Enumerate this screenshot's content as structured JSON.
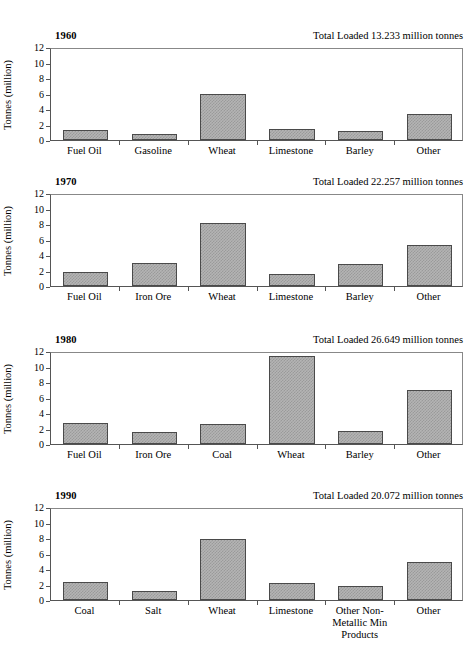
{
  "figure": {
    "ylabel": "Tonnes (million)",
    "y_ticks": [
      "12",
      "10",
      "8",
      "6",
      "4",
      "2",
      "0"
    ],
    "total_prefix": "Total Loaded"
  },
  "chart_data": [
    {
      "type": "bar",
      "title": "1960",
      "subtitle": "Total Loaded  13.233 million tonnes",
      "total_loaded": 13.233,
      "total_units": "million tonnes",
      "xlabel": "",
      "ylabel": "Tonnes (million)",
      "ylim": [
        0,
        12
      ],
      "yticks": [
        0,
        2,
        4,
        6,
        8,
        10,
        12
      ],
      "grid": false,
      "legend": "none",
      "categories": [
        "Fuel Oil",
        "Gasoline",
        "Wheat",
        "Limestone",
        "Barley",
        "Other"
      ],
      "values": [
        1.3,
        0.8,
        5.9,
        1.4,
        1.1,
        3.4
      ]
    },
    {
      "type": "bar",
      "title": "1970",
      "subtitle": "Total Loaded  22.257 million tonnes",
      "total_loaded": 22.257,
      "total_units": "million tonnes",
      "xlabel": "",
      "ylabel": "Tonnes (million)",
      "ylim": [
        0,
        12
      ],
      "yticks": [
        0,
        2,
        4,
        6,
        8,
        10,
        12
      ],
      "grid": false,
      "legend": "none",
      "categories": [
        "Fuel Oil",
        "Iron Ore",
        "Wheat",
        "Limestone",
        "Barley",
        "Other"
      ],
      "values": [
        1.8,
        2.95,
        8.1,
        1.5,
        2.8,
        5.3
      ]
    },
    {
      "type": "bar",
      "title": "1980",
      "subtitle": "Total Loaded  26.649 million tonnes",
      "total_loaded": 26.649,
      "total_units": "million tonnes",
      "xlabel": "",
      "ylabel": "Tonnes (million)",
      "ylim": [
        0,
        12
      ],
      "yticks": [
        0,
        2,
        4,
        6,
        8,
        10,
        12
      ],
      "grid": false,
      "legend": "none",
      "categories": [
        "Fuel Oil",
        "Iron Ore",
        "Coal",
        "Wheat",
        "Barley",
        "Other"
      ],
      "values": [
        2.75,
        1.5,
        2.6,
        11.4,
        1.7,
        7.0
      ]
    },
    {
      "type": "bar",
      "title": "1990",
      "subtitle": "Total Loaded  20.072 million tonnes",
      "total_loaded": 20.072,
      "total_units": "million tonnes",
      "xlabel": "",
      "ylabel": "Tonnes (million)",
      "ylim": [
        0,
        12
      ],
      "yticks": [
        0,
        2,
        4,
        6,
        8,
        10,
        12
      ],
      "grid": false,
      "legend": "none",
      "categories": [
        "Coal",
        "Salt",
        "Wheat",
        "Limestone",
        "Other Non-\nMetallic Min\nProducts",
        "Other"
      ],
      "values": [
        2.35,
        1.1,
        7.9,
        2.25,
        1.85,
        4.85
      ]
    }
  ]
}
